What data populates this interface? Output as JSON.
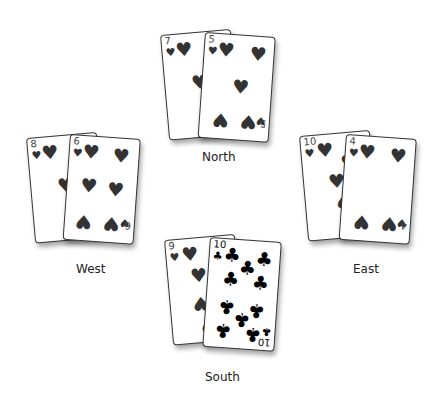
{
  "players": {
    "north": {
      "label": "North",
      "cards": [
        {
          "rank": "7",
          "suit": "♥",
          "suit_name": "hearts"
        },
        {
          "rank": "5",
          "suit": "♥",
          "suit_name": "hearts"
        }
      ]
    },
    "west": {
      "label": "West",
      "cards": [
        {
          "rank": "8",
          "suit": "♥",
          "suit_name": "hearts"
        },
        {
          "rank": "6",
          "suit": "♥",
          "suit_name": "hearts"
        }
      ]
    },
    "east": {
      "label": "East",
      "cards": [
        {
          "rank": "10",
          "suit": "♥",
          "suit_name": "hearts"
        },
        {
          "rank": "4",
          "suit": "♥",
          "suit_name": "hearts"
        }
      ]
    },
    "south": {
      "label": "South",
      "cards": [
        {
          "rank": "9",
          "suit": "♥",
          "suit_name": "hearts"
        },
        {
          "rank": "10",
          "suit": "♣",
          "suit_name": "clubs"
        }
      ]
    }
  },
  "colors": {
    "heart_pip": "#333333",
    "club_pip": "#000000",
    "background": "#ffffff"
  }
}
